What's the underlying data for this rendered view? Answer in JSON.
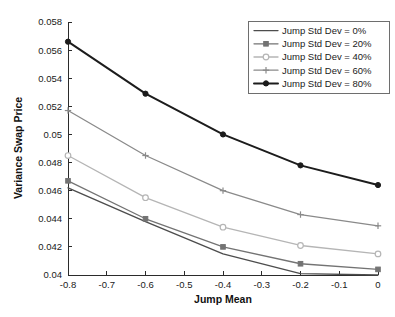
{
  "chart_data": {
    "type": "line",
    "title": "",
    "xlabel": "Jump Mean",
    "ylabel": "Variance Swap Price",
    "x": [
      -0.8,
      -0.6,
      -0.4,
      -0.2,
      0
    ],
    "xlim": [
      -0.8,
      0
    ],
    "ylim": [
      0.04,
      0.058
    ],
    "xticks": [
      -0.8,
      -0.7,
      -0.6,
      -0.5,
      -0.4,
      -0.3,
      -0.2,
      -0.1,
      0
    ],
    "xtick_labels": [
      "-0.8",
      "-0.7",
      "-0.6",
      "-0.5",
      "-0.4",
      "-0.3",
      "-0.2",
      "-0.1",
      "0"
    ],
    "yticks": [
      0.04,
      0.042,
      0.044,
      0.046,
      0.048,
      0.05,
      0.052,
      0.054,
      0.056,
      0.058
    ],
    "ytick_labels": [
      "0.04",
      "0.042",
      "0.044",
      "0.046",
      "0.048",
      "0.05",
      "0.052",
      "0.054",
      "0.056",
      "0.058"
    ],
    "grid": false,
    "legend_position": "top-right",
    "series": [
      {
        "name": "Jump Std Dev = 0%",
        "values": [
          0.0462,
          0.0438,
          0.0415,
          0.0401,
          0.04
        ],
        "color": "#4d4d4d",
        "marker": "none",
        "line_width": 1.4
      },
      {
        "name": "Jump Std Dev = 20%",
        "values": [
          0.0467,
          0.044,
          0.042,
          0.0408,
          0.0404
        ],
        "color": "#737373",
        "marker": "square",
        "line_width": 1.3
      },
      {
        "name": "Jump Std Dev = 40%",
        "values": [
          0.0485,
          0.0455,
          0.0434,
          0.0421,
          0.0415
        ],
        "color": "#b5b5b5",
        "marker": "circle",
        "line_width": 1.3
      },
      {
        "name": "Jump Std Dev = 60%",
        "values": [
          0.0517,
          0.0485,
          0.046,
          0.0443,
          0.0435
        ],
        "color": "#8a8a8a",
        "marker": "plus",
        "line_width": 1.3
      },
      {
        "name": "Jump Std Dev = 80%",
        "values": [
          0.0566,
          0.0529,
          0.05,
          0.0478,
          0.0464
        ],
        "color": "#1c1c1c",
        "marker": "filled-circle",
        "line_width": 2.0
      }
    ]
  },
  "legend": {
    "entries": [
      "Jump Std Dev = 0%",
      "Jump Std Dev = 20%",
      "Jump Std Dev = 40%",
      "Jump Std Dev = 60%",
      "Jump Std Dev = 80%"
    ]
  },
  "axes": {
    "x_title": "Jump Mean",
    "y_title": "Variance Swap Price"
  },
  "colors": {
    "axis": "#2b2b2b",
    "text": "#1a1a1a",
    "background": "#ffffff",
    "legend_border": "#6e6e6e"
  }
}
